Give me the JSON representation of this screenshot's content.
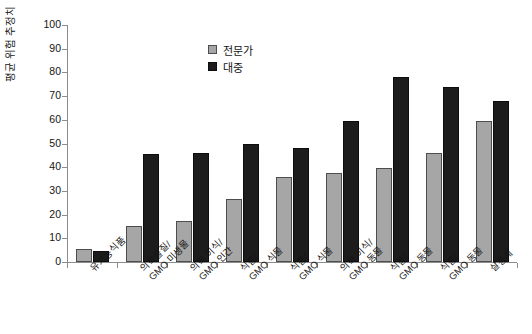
{
  "chart_data": {
    "type": "bar",
    "title": "",
    "subtitle": "",
    "xlabel": "",
    "ylabel": "평균 위험 추정치",
    "ylim": [
      0,
      100
    ],
    "ytick_step": 10,
    "yticks": [
      "0",
      "10",
      "20",
      "30",
      "40",
      "50",
      "60",
      "70",
      "80",
      "90",
      "100"
    ],
    "grid": false,
    "legend_position": "top-center-right",
    "categories": [
      {
        "line1": "유기농식품",
        "line2": ""
      },
      {
        "line1": "의학물질/",
        "line2": "GMO 미생물"
      },
      {
        "line1": "의학 이식/",
        "line2": "GMO 인간"
      },
      {
        "line1": "식품/",
        "line2": "GMO 식물"
      },
      {
        "line1": "식품/",
        "line2": "GMO 식물"
      },
      {
        "line1": "의학 이식/",
        "line2": "GMO 동물"
      },
      {
        "line1": "식품/",
        "line2": "GMO 동물"
      },
      {
        "line1": "식품/",
        "line2": "GMO 동물"
      },
      {
        "line1": "살충제",
        "line2": ""
      }
    ],
    "series": [
      {
        "name": "전문가",
        "color": "#a6a6a6",
        "values": [
          5.5,
          15,
          17.5,
          26.5,
          36,
          37.5,
          39.5,
          46,
          59.5
        ]
      },
      {
        "name": "대중",
        "color": "#1c1c1c",
        "values": [
          4.5,
          45.5,
          46,
          50,
          48,
          59.5,
          78,
          74,
          68
        ]
      }
    ]
  }
}
